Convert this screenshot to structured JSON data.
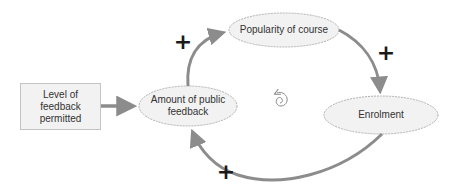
{
  "diagram": {
    "type": "causal-loop",
    "nodes": [
      {
        "id": "level",
        "label": "Level of feedback permitted",
        "lines": [
          "Level of",
          "feedback",
          "permitted"
        ],
        "shape": "rectangle"
      },
      {
        "id": "amount",
        "label": "Amount of public feedback",
        "lines": [
          "Amount of public",
          "feedback"
        ],
        "shape": "ellipse"
      },
      {
        "id": "popularity",
        "label": "Popularity of course",
        "lines": [
          "Popularity of course"
        ],
        "shape": "ellipse"
      },
      {
        "id": "enrolment",
        "label": "Enrolment",
        "lines": [
          "Enrolment"
        ],
        "shape": "ellipse"
      }
    ],
    "edges": [
      {
        "from": "level",
        "to": "amount",
        "polarity": ""
      },
      {
        "from": "amount",
        "to": "popularity",
        "polarity": "+"
      },
      {
        "from": "popularity",
        "to": "enrolment",
        "polarity": "+"
      },
      {
        "from": "enrolment",
        "to": "amount",
        "polarity": "+"
      }
    ],
    "loop_icon": "reinforcing-loop-spiral-icon",
    "colors": {
      "node_fill": "#f2f2f2",
      "node_stroke": "#b0b0b0",
      "arrow": "#8c8c8c",
      "text": "#333333",
      "polarity": "#1a1a1a"
    }
  }
}
